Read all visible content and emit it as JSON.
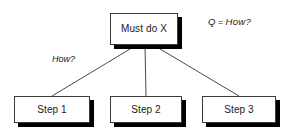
{
  "diagram": {
    "type": "tree",
    "title_node": {
      "id": "root",
      "label": "Must do X"
    },
    "children": [
      {
        "id": "step-1",
        "label": "Step 1"
      },
      {
        "id": "step-2",
        "label": "Step 2"
      },
      {
        "id": "step-3",
        "label": "Step 3"
      }
    ],
    "edge_labels": [
      {
        "id": "how",
        "label": "How?"
      }
    ],
    "legend": {
      "symbol": "Q",
      "equals": "=",
      "meaning": "How?"
    },
    "colors": {
      "background": "#ffffff",
      "box_fill": "#ffffff",
      "box_border": "#3a3a3a",
      "shadow": "#000000",
      "text": "#1a1a1a",
      "connector": "#4a4a4a"
    }
  }
}
